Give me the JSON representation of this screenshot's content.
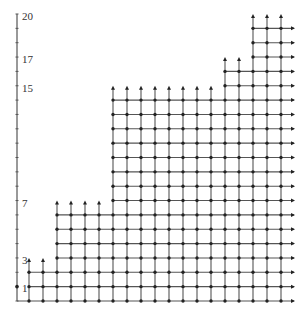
{
  "diagram": {
    "type": "lattice-staircase",
    "y_axis": {
      "labels": [
        "1",
        "3",
        "7",
        "15",
        "17",
        "20"
      ],
      "label_values": [
        1,
        3,
        7,
        15,
        17,
        20
      ],
      "max": 20
    },
    "columns": {
      "count": 19,
      "heights": [
        2,
        2,
        6,
        6,
        6,
        6,
        14,
        14,
        14,
        14,
        14,
        14,
        14,
        14,
        16,
        16,
        19,
        19,
        19
      ],
      "arrow_tips": [
        3,
        3,
        7,
        7,
        7,
        7,
        15,
        15,
        15,
        15,
        15,
        15,
        15,
        15,
        17,
        17,
        20,
        20,
        20
      ]
    },
    "colors": {
      "line": "#555555",
      "node": "#222222",
      "text": "#333333"
    }
  }
}
